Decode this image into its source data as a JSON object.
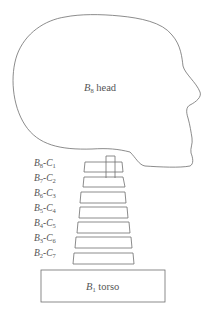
{
  "diagram": {
    "type": "anatomical multibody model",
    "head": {
      "letter": "B",
      "index": "8",
      "text": "head"
    },
    "torso": {
      "letter": "B",
      "index": "1",
      "text": "torso"
    },
    "vertebrae": [
      {
        "b": "8",
        "c": "1"
      },
      {
        "b": "7",
        "c": "2"
      },
      {
        "b": "6",
        "c": "3"
      },
      {
        "b": "5",
        "c": "4"
      },
      {
        "b": "4",
        "c": "5"
      },
      {
        "b": "3",
        "c": "6"
      },
      {
        "b": "2",
        "c": "7"
      }
    ],
    "colors": {
      "stroke": "#6e6e6e",
      "text": "#555555",
      "background": "#ffffff"
    }
  }
}
